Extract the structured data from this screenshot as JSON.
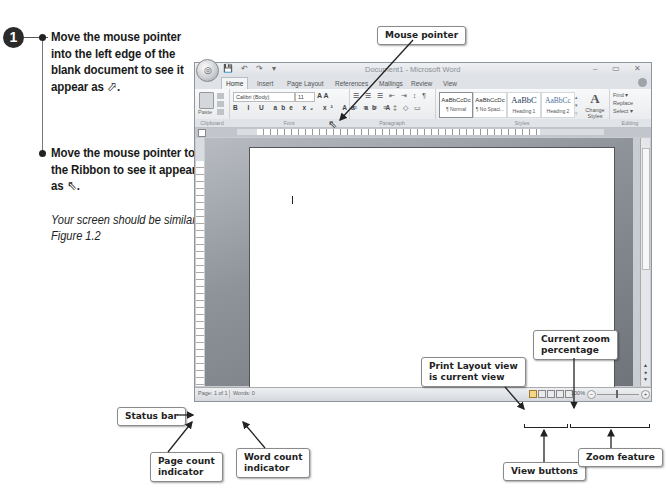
{
  "instructions": {
    "step_number": "1",
    "bullets": [
      {
        "text": "Move the mouse pointer into the left edge of the blank document to see it appear as",
        "glyph": "⬀",
        "glyph_name": "select-arrow-right-pointer"
      },
      {
        "text": "Move the mouse pointer to the Ribbon to see it appear as",
        "glyph": "⇖",
        "glyph_name": "standard-arrow-pointer"
      }
    ],
    "note": "Your screen should be similar to Figure 1.2"
  },
  "window": {
    "title": "Document1 - Microsoft Word",
    "office_button": "◎",
    "quick_access": [
      "💾",
      "↶",
      "↷",
      "▾"
    ],
    "controls": [
      "–",
      "▭",
      "✕"
    ],
    "tabs": [
      "Home",
      "Insert",
      "Page Layout",
      "References",
      "Mailings",
      "Review",
      "View"
    ],
    "active_tab": "Home",
    "ribbon": {
      "clipboard": {
        "label": "Clipboard",
        "paste": "Paste"
      },
      "font": {
        "label": "Font",
        "font_name": "Calibri (Body)",
        "font_size": "11",
        "format_buttons": "B I U abe x₂ x² Aa ab A",
        "grow_shrink": "A A"
      },
      "paragraph": {
        "label": "Paragraph",
        "row1": "☰ ☰ ☰ ⇤ ⇥ ↕ ¶",
        "row2": "≡ ≡ ≡ ≡ ‡ ◇ ▭"
      },
      "styles": {
        "label": "Styles",
        "items": [
          {
            "sample": "AaBbCcDc",
            "name": "¶ Normal"
          },
          {
            "sample": "AaBbCcDc",
            "name": "¶ No Spaci..."
          },
          {
            "sample": "AaBbC",
            "name": "Heading 1"
          },
          {
            "sample": "AaBbCc",
            "name": "Heading 2"
          }
        ],
        "change_styles": "Change Styles"
      },
      "editing": {
        "label": "Editing",
        "items": [
          "Find ▾",
          "Replace",
          "Select ▾"
        ]
      }
    },
    "status_bar": {
      "page": "Page: 1 of 1",
      "words": "Words: 0",
      "zoom_percent": "100%",
      "zoom_minus": "−",
      "zoom_plus": "+"
    }
  },
  "callouts": {
    "mouse_pointer": "Mouse pointer",
    "status_bar": "Status bar",
    "page_count": [
      "Page count",
      "indicator"
    ],
    "word_count": [
      "Word count",
      "indicator"
    ],
    "print_layout": [
      "Print Layout view",
      "is current view"
    ],
    "current_zoom": [
      "Current zoom",
      "percentage"
    ],
    "view_buttons": "View buttons",
    "zoom_feature": "Zoom feature"
  }
}
